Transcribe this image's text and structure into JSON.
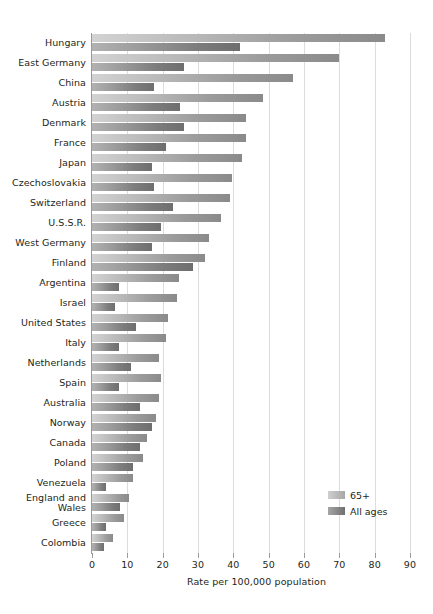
{
  "chart_data": {
    "type": "bar",
    "orientation": "horizontal",
    "title": "",
    "xlabel": "Rate per 100,000 population",
    "ylabel": "",
    "xlim": [
      0,
      90
    ],
    "xticks": [
      0,
      10,
      20,
      30,
      40,
      50,
      60,
      70,
      80,
      90
    ],
    "grid": "vertical",
    "legend_position": "bottom-right",
    "categories": [
      "Hungary",
      "East Germany",
      "China",
      "Austria",
      "Denmark",
      "France",
      "Japan",
      "Czechoslovakia",
      "Switzerland",
      "U.S.S.R.",
      "West Germany",
      "Finland",
      "Argentina",
      "Israel",
      "United States",
      "Italy",
      "Netherlands",
      "Spain",
      "Australia",
      "Norway",
      "Canada",
      "Poland",
      "Venezuela",
      "England and Wales",
      "Greece",
      "Colombia"
    ],
    "series": [
      {
        "name": "65+",
        "color": "#b4b4b4",
        "values": [
          83,
          70,
          57,
          48.5,
          43.5,
          43.5,
          42.5,
          39.5,
          39,
          36.5,
          33,
          32,
          24.5,
          24,
          21.5,
          21,
          19,
          19.5,
          19,
          18,
          15.5,
          14.5,
          11.5,
          10.5,
          9,
          6
        ]
      },
      {
        "name": "All ages",
        "color": "#808080",
        "values": [
          42,
          26,
          17.5,
          25,
          26,
          21,
          17,
          17.5,
          23,
          19.5,
          17,
          28.5,
          7.5,
          6.5,
          12.5,
          7.5,
          11,
          7.5,
          13.5,
          17,
          13.5,
          11.5,
          4,
          8,
          4,
          3.5
        ]
      }
    ]
  },
  "axis": {
    "x_title": "Rate per 100,000 population"
  },
  "legend": {
    "items": [
      {
        "label": "65+",
        "swatch": "legend-swatch-65plus"
      },
      {
        "label": "All ages",
        "swatch": "legend-swatch-all-ages"
      }
    ]
  }
}
